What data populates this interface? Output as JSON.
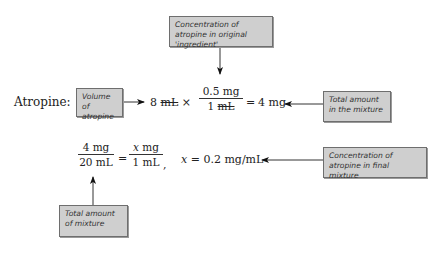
{
  "labels": {
    "concentration_original": "Concentration of atropine in original 'ingredient'",
    "volume": "Volume of atropine",
    "total_amount_mixture": "Total amount in the mixture",
    "concentration_final": "Concentration of atropine in final mixture",
    "total_amount_of_mixture": "Total amount of mixture"
  },
  "equation1": {
    "drug_label": "Atropine:",
    "volume_value": "8",
    "volume_unit": "mL",
    "times": "×",
    "frac_num": "0.5 mg",
    "frac_den_value": "1",
    "frac_den_unit": "mL",
    "equals": "=",
    "result": "4 mg"
  },
  "equation2": {
    "left_num": "4 mg",
    "left_den": "20 mL",
    "equals": "=",
    "right_num_var": "x",
    "right_num_unit": " mg",
    "right_den": "1 mL",
    "comma": ",",
    "var": "x",
    "result": "= 0.2 mg/mL"
  }
}
